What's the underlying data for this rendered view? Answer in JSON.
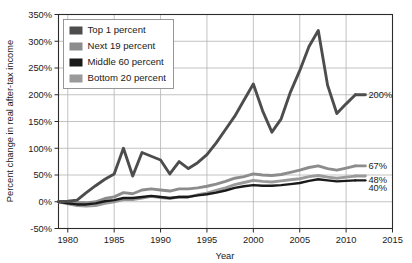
{
  "chart_data": {
    "type": "line",
    "title": "",
    "xlabel": "Year",
    "ylabel": "Percent change in real after-tax income",
    "xlim": [
      1979,
      2015
    ],
    "ylim": [
      -50,
      350
    ],
    "grid": true,
    "legend_position": "top-left-inside",
    "x_ticks": [
      "1980",
      "1985",
      "1990",
      "1995",
      "2000",
      "2005",
      "2010",
      "2015"
    ],
    "x_tick_values": [
      1980,
      1985,
      1990,
      1995,
      2000,
      2005,
      2010,
      2015
    ],
    "y_ticks": [
      "-50%",
      "0%",
      "50%",
      "100%",
      "150%",
      "200%",
      "250%",
      "300%",
      "350%"
    ],
    "y_tick_values": [
      -50,
      0,
      50,
      100,
      150,
      200,
      250,
      300,
      350
    ],
    "x": [
      1979,
      1980,
      1981,
      1982,
      1983,
      1984,
      1985,
      1986,
      1987,
      1988,
      1989,
      1990,
      1991,
      1992,
      1993,
      1994,
      1995,
      1996,
      1997,
      1998,
      1999,
      2000,
      2001,
      2002,
      2003,
      2004,
      2005,
      2006,
      2007,
      2008,
      2009,
      2010,
      2011
    ],
    "series": [
      {
        "name": "Top 1 percent",
        "color": "#4d4d4d",
        "end_label": "200%",
        "end_value": 200,
        "values": [
          0,
          1,
          3,
          17,
          30,
          42,
          52,
          100,
          48,
          92,
          85,
          78,
          52,
          75,
          62,
          73,
          88,
          110,
          135,
          160,
          190,
          220,
          170,
          130,
          155,
          205,
          245,
          290,
          320,
          218,
          165,
          183,
          200
        ]
      },
      {
        "name": "Next 19 percent",
        "color": "#8c8c8c",
        "end_label": "67%",
        "end_value": 67,
        "values": [
          0,
          -1,
          -2,
          -2,
          0,
          6,
          9,
          17,
          15,
          22,
          24,
          22,
          20,
          24,
          24,
          26,
          29,
          33,
          38,
          44,
          47,
          52,
          50,
          49,
          51,
          55,
          59,
          64,
          67,
          62,
          59,
          63,
          67
        ]
      },
      {
        "name": "Middle 60 percent",
        "color": "#1a1a1a",
        "end_label": "40%",
        "end_value": 40,
        "values": [
          0,
          -3,
          -5,
          -5,
          -3,
          1,
          3,
          7,
          7,
          9,
          11,
          9,
          7,
          9,
          9,
          12,
          14,
          17,
          21,
          26,
          29,
          31,
          30,
          30,
          31,
          33,
          35,
          39,
          42,
          40,
          38,
          39,
          40
        ]
      },
      {
        "name": "Bottom 20 percent",
        "color": "#9a9a9a",
        "end_label": "48%",
        "end_value": 48,
        "values": [
          0,
          -4,
          -7,
          -8,
          -7,
          -3,
          0,
          4,
          4,
          7,
          10,
          8,
          6,
          9,
          9,
          13,
          16,
          21,
          26,
          32,
          36,
          40,
          38,
          37,
          39,
          41,
          43,
          47,
          49,
          46,
          44,
          46,
          48
        ]
      }
    ]
  },
  "legend": {
    "items": [
      {
        "label": "Top 1 percent",
        "color": "#4d4d4d"
      },
      {
        "label": "Next 19 percent",
        "color": "#8c8c8c"
      },
      {
        "label": "Middle 60 percent",
        "color": "#1a1a1a"
      },
      {
        "label": "Bottom 20 percent",
        "color": "#9a9a9a"
      }
    ]
  }
}
